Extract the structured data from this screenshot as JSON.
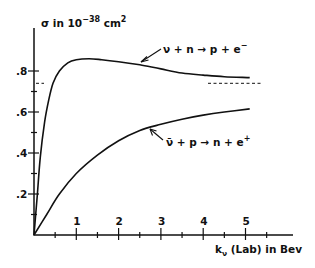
{
  "chart_data": {
    "type": "line",
    "title": "",
    "ylabel": "σ in 10⁻³⁸ cm²",
    "ylabel_parts": {
      "base": "σ  in  10",
      "exp": "−38",
      "unit": " cm",
      "unit_exp": "2"
    },
    "xlabel": "kν (Lab) in Bev",
    "xlabel_parts": {
      "k": "k",
      "sub": "ν",
      "rest": " (Lab) in  Bev"
    },
    "xlim": [
      0,
      5.4
    ],
    "ylim": [
      0,
      0.94
    ],
    "x_ticks": [
      1,
      2,
      3,
      4,
      5
    ],
    "x_tick_labels": [
      "1",
      "2",
      "3",
      "4",
      "5"
    ],
    "x_minor_ticks": [
      0.5,
      1.5,
      2.5,
      3.5,
      4.5,
      5.5
    ],
    "y_ticks": [
      0.2,
      0.4,
      0.6,
      0.8
    ],
    "y_tick_labels": [
      ".2",
      ".4",
      ".6",
      ".8"
    ],
    "y_minor_ticks": [
      0.1,
      0.3,
      0.5,
      0.7
    ],
    "grid": false,
    "legend": "none (inline annotations)",
    "series": [
      {
        "name": "ν + n → p + e⁻",
        "label": "ν + n → p + e⁻",
        "x": [
          0,
          0.08,
          0.15,
          0.25,
          0.35,
          0.45,
          0.6,
          0.8,
          1.0,
          1.3,
          1.6,
          2.0,
          2.5,
          3.0,
          3.5,
          4.0,
          4.5,
          5.1
        ],
        "y": [
          0,
          0.2,
          0.38,
          0.55,
          0.66,
          0.74,
          0.8,
          0.84,
          0.855,
          0.86,
          0.855,
          0.845,
          0.83,
          0.81,
          0.79,
          0.78,
          0.772,
          0.768
        ],
        "asymptote": 0.74
      },
      {
        "name": "ν̄ + p → n + e⁺",
        "label": "ν̄ + p → n + e⁺",
        "x": [
          0,
          0.3,
          0.6,
          1.0,
          1.5,
          2.0,
          2.5,
          3.0,
          3.5,
          4.0,
          4.5,
          5.1
        ],
        "y": [
          0,
          0.1,
          0.2,
          0.3,
          0.39,
          0.46,
          0.51,
          0.54,
          0.565,
          0.585,
          0.6,
          0.615
        ]
      }
    ],
    "annotations": [
      {
        "text": "ν + n → p + e⁻",
        "points_to": "upper curve near k≈2.5"
      },
      {
        "text": "ν̄ + p → n + e⁺",
        "points_to": "lower curve near k≈2.7"
      },
      {
        "text": "dashed asymptote ≈ 0.74",
        "x_range": [
          4.1,
          5.4
        ]
      }
    ]
  },
  "labels": {
    "upper_reaction": {
      "nu": "ν",
      "rest": " + n ",
      "arrow": "→",
      "rest2": " p + e",
      "sup": "−"
    },
    "lower_reaction": {
      "nu": "ν̄",
      "rest": " + p ",
      "arrow": "→",
      "rest2": " n + e",
      "sup": "+"
    }
  }
}
